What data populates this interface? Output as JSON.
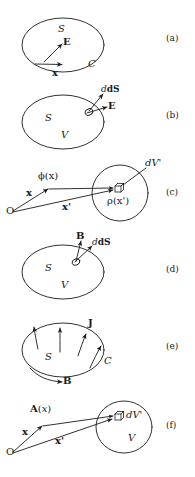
{
  "figure": {
    "name": "electromagnetism-surface-volume-diagrams",
    "background_color": "#ffffff",
    "ink_color": "#1a1a1a",
    "panel_ids": [
      "(a)",
      "(b)",
      "(c)",
      "(d)",
      "(e)",
      "(f)"
    ],
    "panels": [
      {
        "id": "(a)",
        "shape": "ellipse",
        "labels": {
          "surface": "S",
          "curve": "C",
          "field_vector": "E",
          "position_vector": "x"
        }
      },
      {
        "id": "(b)",
        "shape": "ellipse-with-surface-patch",
        "labels": {
          "surface": "S",
          "volume": "V",
          "area_element": "dS",
          "field_vector": "E"
        }
      },
      {
        "id": "(c)",
        "shape": "circle-with-volume-element",
        "labels": {
          "origin": "O",
          "field_point_vector": "x",
          "source_point_vector": "x'",
          "potential": "ϕ(x)",
          "volume_element": "dV'",
          "charge_density": "ρ(x')"
        }
      },
      {
        "id": "(d)",
        "shape": "ellipse-with-surface-patch",
        "labels": {
          "surface": "S",
          "volume": "V",
          "area_element": "dS",
          "field_vector": "B"
        }
      },
      {
        "id": "(e)",
        "shape": "ellipse-with-current-arrows",
        "labels": {
          "surface": "S",
          "curve": "C",
          "current_density": "J",
          "field_vector": "B"
        }
      },
      {
        "id": "(f)",
        "shape": "circle-with-volume-element",
        "labels": {
          "origin": "O",
          "field_point_vector": "x",
          "source_point_vector": "x'",
          "vector_potential": "A(x)",
          "volume_element": "dV'",
          "volume": "V"
        }
      }
    ]
  }
}
